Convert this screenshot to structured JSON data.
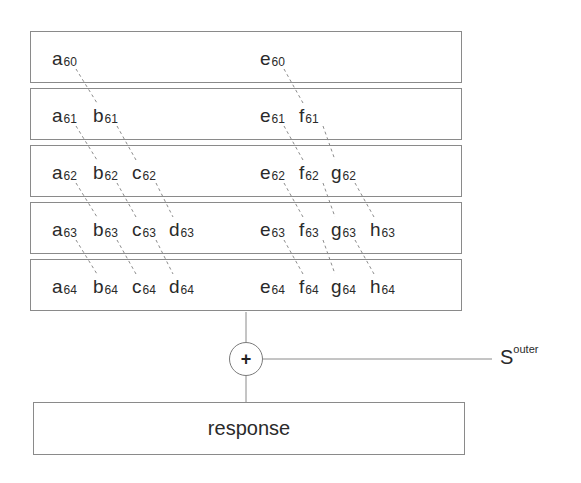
{
  "diagram": {
    "rows": [
      {
        "left": [
          {
            "letter": "a",
            "sub": "60"
          }
        ],
        "right": [
          {
            "letter": "e",
            "sub": "60"
          }
        ]
      },
      {
        "left": [
          {
            "letter": "a",
            "sub": "61"
          },
          {
            "letter": "b",
            "sub": "61"
          }
        ],
        "right": [
          {
            "letter": "e",
            "sub": "61"
          },
          {
            "letter": "f",
            "sub": "61"
          }
        ]
      },
      {
        "left": [
          {
            "letter": "a",
            "sub": "62"
          },
          {
            "letter": "b",
            "sub": "62"
          },
          {
            "letter": "c",
            "sub": "62"
          }
        ],
        "right": [
          {
            "letter": "e",
            "sub": "62"
          },
          {
            "letter": "f",
            "sub": "62"
          },
          {
            "letter": "g",
            "sub": "62"
          }
        ]
      },
      {
        "left": [
          {
            "letter": "a",
            "sub": "63"
          },
          {
            "letter": "b",
            "sub": "63"
          },
          {
            "letter": "c",
            "sub": "63"
          },
          {
            "letter": "d",
            "sub": "63"
          }
        ],
        "right": [
          {
            "letter": "e",
            "sub": "63"
          },
          {
            "letter": "f",
            "sub": "63"
          },
          {
            "letter": "g",
            "sub": "63"
          },
          {
            "letter": "h",
            "sub": "63"
          }
        ]
      },
      {
        "left": [
          {
            "letter": "a",
            "sub": "64"
          },
          {
            "letter": "b",
            "sub": "64"
          },
          {
            "letter": "c",
            "sub": "64"
          },
          {
            "letter": "d",
            "sub": "64"
          }
        ],
        "right": [
          {
            "letter": "e",
            "sub": "64"
          },
          {
            "letter": "f",
            "sub": "64"
          },
          {
            "letter": "g",
            "sub": "64"
          },
          {
            "letter": "h",
            "sub": "64"
          }
        ]
      }
    ],
    "sum_symbol": "+",
    "side_input": {
      "base": "S",
      "sup": "outer"
    },
    "output_label": "response"
  },
  "colors": {
    "box_border": "#8a8a8a",
    "dash_line": "#8c8c8c",
    "text": "#2a2a2a"
  }
}
